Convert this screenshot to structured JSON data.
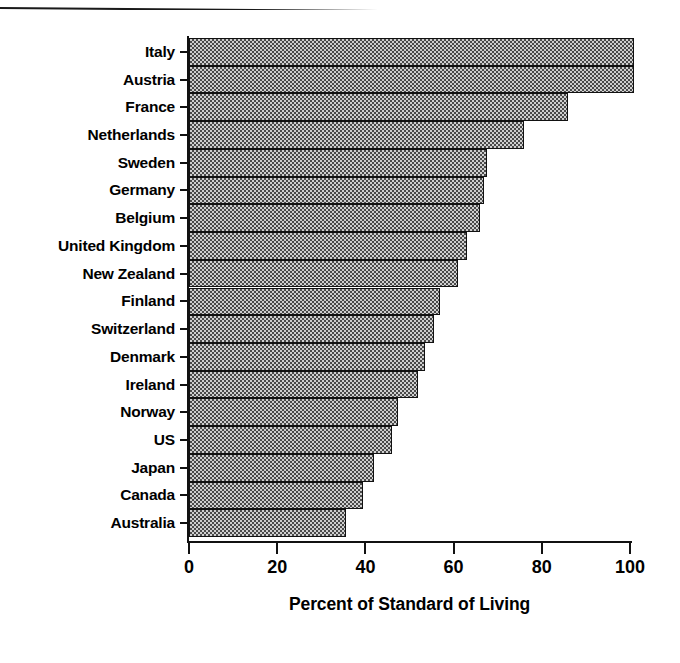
{
  "chart_data": {
    "type": "bar",
    "orientation": "horizontal",
    "title": "",
    "subtitle": "",
    "xlabel": "Percent of Standard of Living",
    "ylabel": "",
    "categories": [
      "Italy",
      "Austria",
      "France",
      "Netherlands",
      "Sweden",
      "Germany",
      "Belgium",
      "United Kingdom",
      "New Zealand",
      "Finland",
      "Switzerland",
      "Denmark",
      "Ireland",
      "Norway",
      "US",
      "Japan",
      "Canada",
      "Australia"
    ],
    "values": [
      101,
      101,
      86,
      76,
      67.5,
      67,
      66,
      63,
      61,
      57,
      55.5,
      53.5,
      52,
      47.5,
      46,
      42,
      39.5,
      35.5
    ],
    "xlim": [
      0,
      100
    ],
    "xticks": [
      0,
      20,
      40,
      60,
      80,
      100
    ],
    "xtick_labels": [
      "0",
      "20",
      "40",
      "60",
      "80",
      "100"
    ],
    "grid": false,
    "legend": false,
    "bar_fill": "#cfcfcf",
    "bar_pattern": "checkerboard-dither",
    "bar_edge_color": "#111111",
    "axis_color": "#111111",
    "background": "#ffffff"
  },
  "figure": {
    "top_rule": "horizontal-rule"
  }
}
